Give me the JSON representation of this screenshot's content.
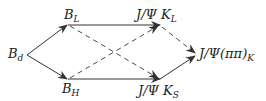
{
  "diagram": {
    "colors": {
      "line": "#333333",
      "text": "#222222",
      "background": "#ffffff"
    },
    "nodes": {
      "bd": {
        "main": "B",
        "sub": "d"
      },
      "bl": {
        "main": "B",
        "sub": "L"
      },
      "bh": {
        "main": "B",
        "sub": "H"
      },
      "jpsi_kl": {
        "main": "J/Ψ K",
        "sub": "L"
      },
      "jpsi_ks": {
        "main": "J/Ψ K",
        "sub": "S"
      },
      "jpsi_pipi": {
        "main": "J/Ψ(ππ)",
        "sub": "K"
      }
    },
    "edges": [
      {
        "from": "B_d",
        "to": "B_L",
        "style": "solid-arrow"
      },
      {
        "from": "B_d",
        "to": "B_H",
        "style": "solid-arrow"
      },
      {
        "from": "B_L",
        "to": "J/Ψ K_L",
        "style": "solid-arrow"
      },
      {
        "from": "B_H",
        "to": "J/Ψ K_S",
        "style": "solid-arrow"
      },
      {
        "from": "B_L",
        "to": "J/Ψ K_S",
        "style": "dashed-arrow"
      },
      {
        "from": "B_H",
        "to": "J/Ψ K_L",
        "style": "dashed-arrow"
      },
      {
        "from": "J/Ψ K_L",
        "to": "J/Ψ(ππ)_K",
        "style": "dashed-arrow"
      },
      {
        "from": "J/Ψ K_S",
        "to": "J/Ψ(ππ)_K",
        "style": "solid-arrow"
      }
    ]
  }
}
